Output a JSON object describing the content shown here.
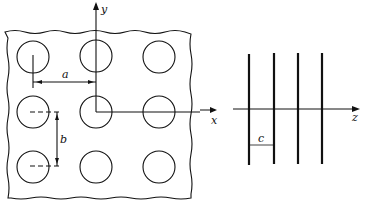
{
  "labels": {
    "y_axis": "y",
    "x_axis": "x",
    "z_axis": "z",
    "spacing_a": "a",
    "spacing_b": "b",
    "spacing_c": "c"
  },
  "left_panel": {
    "description": "square array of circular rods, 3x3",
    "rows": 3,
    "cols": 3
  },
  "right_panel": {
    "description": "parallel plates/lines along z",
    "count": 4
  }
}
